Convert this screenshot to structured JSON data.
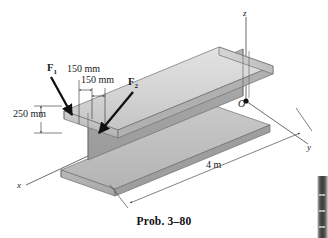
{
  "figure": {
    "caption": "Prob. 3–80"
  },
  "axes": {
    "z_label": "z",
    "y_label": "y",
    "x_label": "x",
    "origin_label": "O"
  },
  "forces": [
    {
      "name": "F1",
      "label": "F",
      "sub": "1"
    },
    {
      "name": "F2",
      "label": "F",
      "sub": "2"
    }
  ],
  "dimensions": [
    {
      "name": "offset-1",
      "value": "150 mm"
    },
    {
      "name": "offset-2",
      "value": "150 mm"
    },
    {
      "name": "depth",
      "value": "250 mm"
    },
    {
      "name": "length",
      "value": "4 m"
    }
  ],
  "colors": {
    "beam_top_light": "#dcdcdc",
    "beam_top_mid": "#c6c6c6",
    "beam_web": "#aaaaaa",
    "beam_web_dark": "#9a9a9a",
    "beam_bottom": "#bdbdbd",
    "outline": "#4a4a4a",
    "axis_line": "#5a5a5a",
    "arrow": "#111111",
    "text": "#1a1a1a"
  }
}
